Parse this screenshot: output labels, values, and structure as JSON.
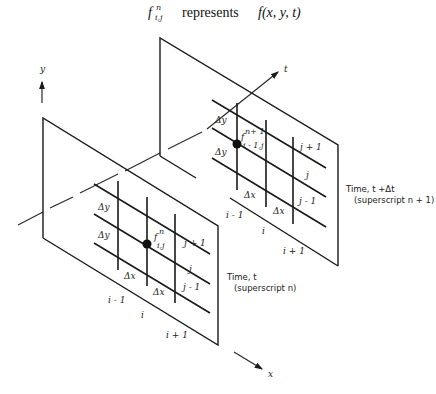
{
  "header": {
    "symbol": "f",
    "symbol_sup": "n",
    "symbol_sub": "i,j",
    "verb": "represents",
    "function": "f(x, y, t)"
  },
  "axes": {
    "y_label": "y",
    "t_label": "t",
    "x_label": "x"
  },
  "plane_t": {
    "caption_line1": "Time, t",
    "caption_line2": "(superscript n)",
    "point_label_base": "f",
    "point_label_sup": "n",
    "point_label_sub": "i,j",
    "dy_label": "Δy",
    "dx_label": "Δx",
    "row_labels": [
      "j + 1",
      "j",
      "j - 1"
    ],
    "col_labels": [
      "i - 1",
      "i",
      "i + 1"
    ]
  },
  "plane_t_dt": {
    "caption_line1": "Time, t +Δt",
    "caption_line2": "(superscript n + 1)",
    "point_label_base": "f",
    "point_label_sup": "n+ 1",
    "point_label_sub": "i - 1,j",
    "dy_label": "Δy",
    "dx_label": "Δx",
    "row_labels": [
      "j + 1",
      "j",
      "j - 1"
    ],
    "col_labels": [
      "i - 1",
      "i",
      "i + 1"
    ]
  }
}
